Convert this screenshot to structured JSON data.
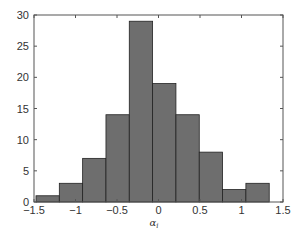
{
  "chart_data": {
    "type": "bar",
    "subtype": "histogram",
    "title": "",
    "xlabel": "α_i",
    "ylabel": "",
    "xlim": [
      -1.5,
      1.5
    ],
    "ylim": [
      0,
      30
    ],
    "xticks": [
      -1.5,
      -1,
      -0.5,
      0,
      0.5,
      1,
      1.5
    ],
    "xtick_labels": [
      "-1.5",
      "-1",
      "-0.5",
      "0",
      "0.5",
      "1",
      "1.5"
    ],
    "yticks": [
      0,
      5,
      10,
      15,
      20,
      25,
      30
    ],
    "ytick_labels": [
      "0",
      "5",
      "10",
      "15",
      "20",
      "25",
      "30"
    ],
    "grid": false,
    "legend": null,
    "bin_edges": [
      -1.476,
      -1.195,
      -0.914,
      -0.633,
      -0.352,
      -0.071,
      0.21,
      0.491,
      0.772,
      1.053,
      1.334
    ],
    "categories": [
      "-1.34",
      "-1.05",
      "-0.77",
      "-0.49",
      "-0.21",
      "0.07",
      "0.35",
      "0.63",
      "0.91",
      "1.19"
    ],
    "values": [
      1,
      3,
      7,
      14,
      29,
      19,
      14,
      8,
      2,
      3
    ],
    "bar_color": "#6e6e6e",
    "edge_color": "#222222"
  },
  "xlabel_main": "α",
  "xlabel_sub": "i"
}
